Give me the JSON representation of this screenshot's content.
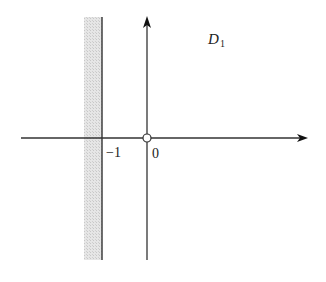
{
  "diagram": {
    "region_label": "D",
    "region_subscript": "1",
    "tick_labels": {
      "minus_one": "−1",
      "origin": "0"
    },
    "boundary": {
      "line_value": -1,
      "shaded_side": "left",
      "origin_excluded": true
    },
    "colors": {
      "axis": "#333333",
      "shade": "#d9d9d9"
    }
  }
}
